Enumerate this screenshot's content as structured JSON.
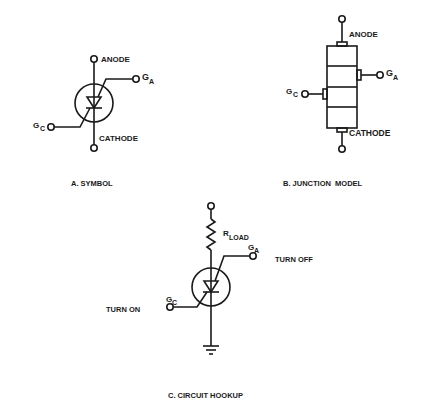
{
  "diagram": {
    "colors": {
      "ink": "#1a1a1a",
      "background": "#ffffff"
    },
    "panel_a": {
      "caption": "A. SYMBOL",
      "anode_label": "ANODE",
      "cathode_label": "CATHODE",
      "gate_anode_label": "G",
      "gate_anode_sub": "A",
      "gate_cathode_label": "G",
      "gate_cathode_sub": "C"
    },
    "panel_b": {
      "caption": "B. JUNCTION  MODEL",
      "anode_label": "ANODE",
      "cathode_label": "CATHODE",
      "gate_anode_label": "G",
      "gate_anode_sub": "A",
      "gate_cathode_label": "G",
      "gate_cathode_sub": "C",
      "layers": 4
    },
    "panel_c": {
      "caption": "C. CIRCUIT HOOKUP",
      "load_label": "R",
      "load_sub": "LOAD",
      "gate_anode_label": "G",
      "gate_anode_sub": "A",
      "gate_cathode_label": "G",
      "gate_cathode_sub": "C",
      "turn_off_label": "TURN OFF",
      "turn_on_label": "TURN ON"
    }
  }
}
